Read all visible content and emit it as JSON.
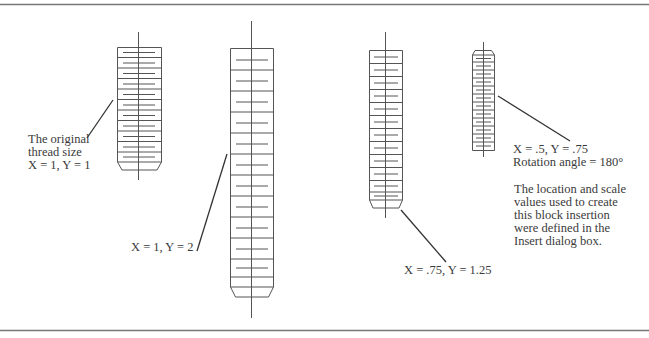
{
  "figure": {
    "stroke_color": "#555555",
    "border_color": "#777777",
    "text_color": "#3a3a3a"
  },
  "blocks": [
    {
      "id": "original",
      "scale_x": 1,
      "scale_y": 1,
      "rotation": 0,
      "label_lines": [
        "The original",
        "thread size",
        "X = 1, Y = 1"
      ]
    },
    {
      "id": "scaled-y2",
      "scale_x": 1,
      "scale_y": 2,
      "rotation": 0,
      "label_lines": [
        "X = 1, Y = 2"
      ]
    },
    {
      "id": "scaled-075-125",
      "scale_x": 0.75,
      "scale_y": 1.25,
      "rotation": 0,
      "label_lines": [
        "X = .75, Y = 1.25"
      ]
    },
    {
      "id": "scaled-rotated",
      "scale_x": 0.5,
      "scale_y": 0.75,
      "rotation": 180,
      "label_lines": [
        "X = .5, Y = .75",
        "Rotation angle = 180°"
      ]
    }
  ],
  "note": {
    "lines": [
      "The location and scale",
      "values used to create",
      "this block insertion",
      "were defined in the",
      "Insert dialog box."
    ]
  }
}
